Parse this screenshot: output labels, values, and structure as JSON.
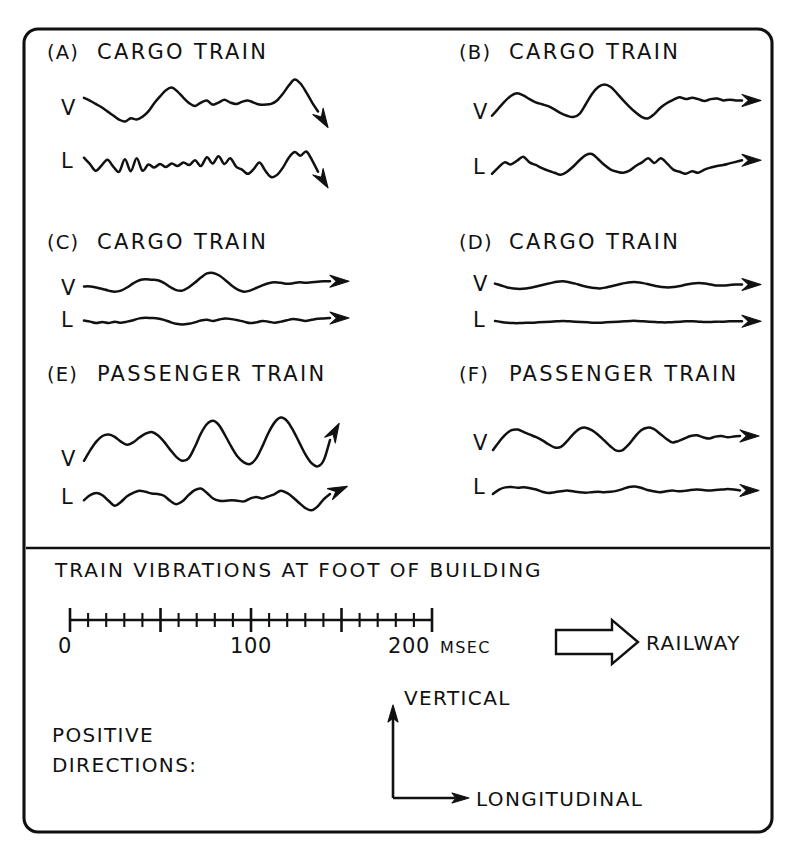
{
  "figure": {
    "caption": "TRAIN VIBRATIONS AT FOOT OF BUILDING",
    "frame_color": "#101010",
    "trace_color": "#111111",
    "background": "#ffffff"
  },
  "panels": [
    {
      "tag": "(A)",
      "title": "CARGO TRAIN",
      "arrow_direction": "down-right"
    },
    {
      "tag": "(B)",
      "title": "CARGO TRAIN",
      "arrow_direction": "right"
    },
    {
      "tag": "(C)",
      "title": "CARGO TRAIN",
      "arrow_direction": "right"
    },
    {
      "tag": "(D)",
      "title": "CARGO TRAIN",
      "arrow_direction": "right"
    },
    {
      "tag": "(E)",
      "title": "PASSENGER TRAIN",
      "arrow_direction": "up-right"
    },
    {
      "tag": "(F)",
      "title": "PASSENGER TRAIN",
      "arrow_direction": "right"
    }
  ],
  "trace_labels": {
    "vertical": "V",
    "longitudinal": "L"
  },
  "time_scale": {
    "major_labels": [
      "0",
      "100",
      "200"
    ],
    "unit": "MSEC",
    "min": 0,
    "max": 200,
    "major_interval": 50,
    "minor_interval": 10
  },
  "railway_legend": {
    "label": "RAILWAY",
    "icon": "block-arrow-right-icon"
  },
  "positive_directions": {
    "line1": "POSITIVE",
    "line2": "DIRECTIONS:",
    "vertical_axis_label": "VERTICAL",
    "longitudinal_axis_label": "LONGITUDINAL"
  },
  "chart_data": {
    "type": "line",
    "title": "TRAIN VIBRATIONS AT FOOT OF BUILDING",
    "xlabel": "MSEC",
    "ylabel": "",
    "xlim": [
      0,
      200
    ],
    "grid": false,
    "legend": "none",
    "note": "Six seismograph-style panels; each panel has a Vertical (V) and Longitudinal (L) velocity trace over ~0-200 msec. Values are normalized waveform amplitudes sampled evenly across the trace width.",
    "panels": [
      {
        "tag": "(A)",
        "title": "CARGO TRAIN",
        "series": [
          {
            "name": "V",
            "values": [
              0.3,
              0.22,
              0.12,
              0.02,
              -0.1,
              -0.22,
              -0.34,
              -0.4,
              -0.3,
              -0.34,
              -0.26,
              -0.1,
              0.14,
              0.34,
              0.52,
              0.6,
              0.48,
              0.3,
              0.14,
              0.06,
              0.16,
              0.22,
              0.1,
              0.16,
              0.24,
              0.16,
              0.12,
              0.18,
              0.22,
              0.16,
              0.1,
              0.1,
              0.12,
              0.22,
              0.42,
              0.66,
              0.84,
              0.72,
              0.46,
              0.16,
              -0.1
            ]
          },
          {
            "name": "L",
            "values": [
              0.28,
              0.04,
              -0.22,
              -0.02,
              0.2,
              -0.06,
              -0.26,
              0.22,
              -0.24,
              0.26,
              -0.22,
              0.02,
              -0.1,
              0.04,
              -0.08,
              0.06,
              -0.04,
              0.1,
              0.0,
              0.18,
              -0.04,
              0.3,
              0.06,
              0.34,
              0.04,
              0.26,
              -0.06,
              -0.18,
              -0.34,
              -0.16,
              0.1,
              -0.22,
              -0.46,
              -0.38,
              -0.1,
              0.28,
              0.5,
              0.36,
              0.52,
              0.18,
              -0.26
            ]
          }
        ]
      },
      {
        "tag": "(B)",
        "title": "CARGO TRAIN",
        "series": [
          {
            "name": "V",
            "values": [
              -0.18,
              0.04,
              0.26,
              0.44,
              0.52,
              0.46,
              0.34,
              0.24,
              0.18,
              0.12,
              0.02,
              -0.1,
              -0.18,
              -0.22,
              -0.12,
              0.18,
              0.5,
              0.72,
              0.8,
              0.72,
              0.52,
              0.3,
              0.1,
              -0.08,
              -0.22,
              -0.26,
              -0.12,
              0.08,
              0.22,
              0.32,
              0.4,
              0.34,
              0.38,
              0.34,
              0.28,
              0.34,
              0.36,
              0.3,
              0.32,
              0.3,
              0.3
            ]
          },
          {
            "name": "L",
            "values": [
              -0.3,
              -0.06,
              0.14,
              0.06,
              0.2,
              0.36,
              0.14,
              0.04,
              -0.08,
              -0.18,
              -0.26,
              -0.34,
              -0.22,
              -0.02,
              0.22,
              0.42,
              0.46,
              0.26,
              0.04,
              -0.14,
              -0.22,
              -0.26,
              -0.18,
              0.0,
              0.14,
              0.3,
              0.12,
              0.3,
              0.1,
              -0.14,
              -0.22,
              -0.3,
              -0.2,
              -0.26,
              -0.14,
              -0.06,
              0.0,
              0.04,
              0.1,
              0.16,
              0.22
            ]
          }
        ]
      },
      {
        "tag": "(C)",
        "title": "CARGO TRAIN",
        "series": [
          {
            "name": "V",
            "values": [
              0.06,
              0.06,
              0.02,
              -0.04,
              -0.1,
              -0.14,
              -0.1,
              0.02,
              0.18,
              0.3,
              0.34,
              0.32,
              0.3,
              0.2,
              0.04,
              -0.08,
              -0.1,
              0.02,
              0.2,
              0.4,
              0.56,
              0.58,
              0.48,
              0.3,
              0.1,
              -0.06,
              -0.14,
              -0.1,
              0.0,
              0.1,
              0.18,
              0.22,
              0.2,
              0.16,
              0.18,
              0.22,
              0.2,
              0.22,
              0.24,
              0.26,
              0.26
            ]
          },
          {
            "name": "L",
            "values": [
              0.08,
              0.02,
              -0.06,
              0.0,
              -0.06,
              0.02,
              -0.04,
              0.02,
              0.1,
              0.2,
              0.24,
              0.22,
              0.2,
              0.12,
              0.0,
              -0.1,
              -0.14,
              -0.1,
              -0.02,
              0.08,
              0.12,
              0.06,
              0.14,
              0.2,
              0.16,
              0.1,
              0.02,
              -0.06,
              -0.02,
              0.06,
              0.02,
              -0.04,
              0.02,
              0.1,
              0.16,
              0.12,
              0.06,
              0.12,
              0.18,
              0.2,
              0.22
            ]
          }
        ]
      },
      {
        "tag": "(D)",
        "title": "CARGO TRAIN",
        "series": [
          {
            "name": "V",
            "values": [
              0.1,
              0.02,
              -0.06,
              -0.1,
              -0.12,
              -0.1,
              -0.06,
              0.0,
              0.06,
              0.12,
              0.18,
              0.2,
              0.16,
              0.1,
              0.02,
              -0.04,
              -0.08,
              -0.1,
              -0.06,
              0.0,
              0.06,
              0.12,
              0.16,
              0.16,
              0.12,
              0.06,
              0.0,
              -0.04,
              -0.06,
              -0.04,
              0.0,
              0.06,
              0.1,
              0.12,
              0.1,
              0.06,
              0.02,
              0.02,
              0.04,
              0.06,
              0.06
            ]
          },
          {
            "name": "L",
            "values": [
              0.06,
              0.0,
              -0.04,
              -0.06,
              -0.06,
              -0.04,
              -0.04,
              -0.02,
              0.0,
              0.02,
              0.04,
              0.06,
              0.04,
              0.02,
              0.0,
              -0.02,
              -0.04,
              -0.04,
              -0.02,
              0.0,
              0.02,
              0.04,
              0.06,
              0.06,
              0.04,
              0.02,
              0.0,
              -0.02,
              -0.02,
              0.0,
              0.02,
              0.04,
              0.04,
              0.02,
              0.0,
              0.0,
              0.02,
              0.02,
              0.04,
              0.04,
              0.04
            ]
          }
        ]
      },
      {
        "tag": "(E)",
        "title": "PASSENGER TRAIN",
        "series": [
          {
            "name": "V",
            "values": [
              -0.22,
              0.04,
              0.26,
              0.4,
              0.44,
              0.38,
              0.26,
              0.18,
              0.24,
              0.36,
              0.46,
              0.5,
              0.42,
              0.26,
              0.06,
              -0.12,
              -0.22,
              -0.16,
              0.12,
              0.46,
              0.7,
              0.78,
              0.66,
              0.4,
              0.12,
              -0.12,
              -0.26,
              -0.3,
              -0.16,
              0.14,
              0.48,
              0.74,
              0.86,
              0.78,
              0.54,
              0.24,
              -0.06,
              -0.28,
              -0.36,
              -0.2,
              0.3
            ]
          },
          {
            "name": "L",
            "values": [
              -0.08,
              0.1,
              0.18,
              0.1,
              -0.1,
              -0.28,
              -0.14,
              0.06,
              0.18,
              0.26,
              0.22,
              0.16,
              0.14,
              0.08,
              -0.1,
              -0.22,
              -0.12,
              0.1,
              0.28,
              0.34,
              0.18,
              -0.02,
              -0.1,
              -0.1,
              -0.08,
              -0.1,
              -0.12,
              -0.02,
              0.04,
              -0.02,
              0.06,
              0.14,
              0.26,
              0.18,
              0.02,
              -0.18,
              -0.36,
              -0.44,
              -0.3,
              -0.04,
              0.14
            ]
          }
        ]
      },
      {
        "tag": "(F)",
        "title": "PASSENGER TRAIN",
        "series": [
          {
            "name": "V",
            "values": [
              -0.22,
              0.04,
              0.26,
              0.4,
              0.42,
              0.34,
              0.26,
              0.18,
              0.08,
              -0.04,
              -0.14,
              -0.12,
              0.06,
              0.28,
              0.44,
              0.48,
              0.4,
              0.26,
              0.08,
              -0.1,
              -0.24,
              -0.22,
              -0.04,
              0.2,
              0.4,
              0.48,
              0.44,
              0.3,
              0.14,
              0.02,
              0.06,
              0.14,
              0.22,
              0.24,
              0.18,
              0.14,
              0.2,
              0.22,
              0.18,
              0.2,
              0.22
            ]
          },
          {
            "name": "L",
            "values": [
              -0.18,
              0.02,
              0.12,
              0.14,
              0.1,
              0.12,
              0.08,
              0.02,
              -0.08,
              -0.14,
              -0.1,
              -0.06,
              -0.02,
              -0.06,
              -0.1,
              -0.12,
              -0.1,
              -0.08,
              -0.1,
              -0.08,
              -0.04,
              0.04,
              0.14,
              0.16,
              0.1,
              0.0,
              -0.06,
              -0.1,
              -0.06,
              -0.02,
              -0.06,
              -0.04,
              0.0,
              0.02,
              0.0,
              -0.02,
              0.0,
              0.02,
              0.04,
              0.02,
              -0.02
            ]
          }
        ]
      }
    ]
  }
}
